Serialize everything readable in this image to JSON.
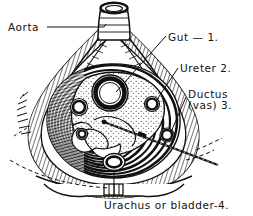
{
  "figure": {
    "kind": "anatomical-line-drawing",
    "style": "pen-and-ink engraving with hatching and stippling",
    "background_color": "#ffffff",
    "ink_color": "#111111"
  },
  "labels": {
    "aorta": "Aorta",
    "gut": "Gut — 1.",
    "ureter": "Ureter 2.",
    "ductus_line1": "Ductus",
    "ductus_line2": "(vas) 3.",
    "urachus": "Urachus or bladder-4."
  },
  "numbering": {
    "gut": "1.",
    "ureter": "2.",
    "ductus_vas": "3.",
    "urachus_bladder": "4."
  },
  "structures": [
    {
      "name": "aorta-stump",
      "shape": "open tube at top, bifurcating"
    },
    {
      "name": "gut-ring",
      "shape": "large thick black annulus"
    },
    {
      "name": "ureter-ring",
      "shape": "small annulus, right of centre"
    },
    {
      "name": "ductus-vas-ring",
      "shape": "small annulus, lower right"
    },
    {
      "name": "urachus-ring",
      "shape": "small annulus, bottom centre"
    },
    {
      "name": "accessory-ring-upper-left",
      "shape": "small annulus"
    },
    {
      "name": "accessory-ring-lower-left",
      "shape": "tiny annulus"
    },
    {
      "name": "probe",
      "shape": "long needle crossing to lower right"
    },
    {
      "name": "body-wall",
      "shape": "hatched outer band, teardrop outline"
    },
    {
      "name": "visceral-mass",
      "shape": "stippled central mass"
    }
  ]
}
